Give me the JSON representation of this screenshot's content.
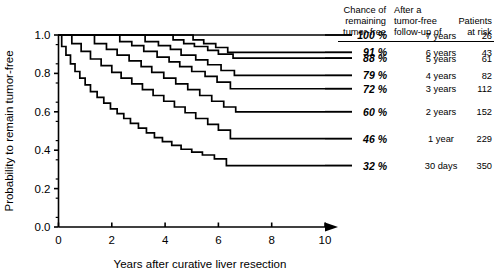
{
  "chart_data": {
    "type": "line",
    "title": "",
    "xlabel": "Years after curative liver resection",
    "ylabel": "Probability to remain tumor-free",
    "xlim": [
      0,
      10
    ],
    "ylim": [
      0,
      1.0
    ],
    "xticks": [
      "0",
      "2",
      "4",
      "6",
      "8",
      "10"
    ],
    "yticks": [
      "0.0",
      "0.2",
      "0.4",
      "0.6",
      "0.8",
      "1.0"
    ],
    "grid": false,
    "legend_position": "right-outside",
    "minor_ticks": true,
    "x_axis_arrow": true,
    "series": [
      {
        "name": "7 years",
        "chance_percent": "100 %",
        "followup": "7 years",
        "patients_at_risk": "26",
        "plateau_value": 1.0,
        "points": [
          [
            0.0,
            1.0
          ],
          [
            6.7,
            1.0
          ],
          [
            10.0,
            1.0
          ]
        ]
      },
      {
        "name": "6 years",
        "chance_percent": "91 %",
        "followup": "6 years",
        "patients_at_risk": "43",
        "plateau_value": 0.91,
        "points": [
          [
            0.0,
            1.0
          ],
          [
            5.05,
            1.0
          ],
          [
            5.05,
            0.975
          ],
          [
            5.45,
            0.975
          ],
          [
            5.45,
            0.955
          ],
          [
            5.9,
            0.955
          ],
          [
            5.9,
            0.935
          ],
          [
            6.35,
            0.935
          ],
          [
            6.35,
            0.91
          ],
          [
            10.0,
            0.91
          ]
        ]
      },
      {
        "name": "5 years",
        "chance_percent": "88 %",
        "followup": "5 years",
        "patients_at_risk": "61",
        "plateau_value": 0.88,
        "points": [
          [
            0.0,
            1.0
          ],
          [
            4.3,
            1.0
          ],
          [
            4.3,
            0.975
          ],
          [
            4.7,
            0.975
          ],
          [
            4.7,
            0.955
          ],
          [
            5.1,
            0.955
          ],
          [
            5.1,
            0.94
          ],
          [
            5.6,
            0.94
          ],
          [
            5.6,
            0.92
          ],
          [
            6.0,
            0.92
          ],
          [
            6.0,
            0.9
          ],
          [
            6.55,
            0.9
          ],
          [
            6.55,
            0.88
          ],
          [
            10.0,
            0.88
          ]
        ]
      },
      {
        "name": "4 years",
        "chance_percent": "79 %",
        "followup": "4 years",
        "patients_at_risk": "82",
        "plateau_value": 0.79,
        "points": [
          [
            0.0,
            1.0
          ],
          [
            3.25,
            1.0
          ],
          [
            3.25,
            0.965
          ],
          [
            3.75,
            0.965
          ],
          [
            3.75,
            0.945
          ],
          [
            4.2,
            0.945
          ],
          [
            4.2,
            0.925
          ],
          [
            4.6,
            0.925
          ],
          [
            4.6,
            0.895
          ],
          [
            5.15,
            0.895
          ],
          [
            5.15,
            0.87
          ],
          [
            5.6,
            0.87
          ],
          [
            5.6,
            0.845
          ],
          [
            6.1,
            0.845
          ],
          [
            6.1,
            0.815
          ],
          [
            6.6,
            0.815
          ],
          [
            6.6,
            0.79
          ],
          [
            10.0,
            0.79
          ]
        ]
      },
      {
        "name": "3 years",
        "chance_percent": "72 %",
        "followup": "3 years",
        "patients_at_risk": "112",
        "plateau_value": 0.72,
        "points": [
          [
            0.0,
            1.0
          ],
          [
            2.3,
            1.0
          ],
          [
            2.3,
            0.965
          ],
          [
            2.75,
            0.965
          ],
          [
            2.75,
            0.945
          ],
          [
            3.2,
            0.945
          ],
          [
            3.2,
            0.915
          ],
          [
            3.7,
            0.915
          ],
          [
            3.7,
            0.885
          ],
          [
            4.15,
            0.885
          ],
          [
            4.15,
            0.86
          ],
          [
            4.55,
            0.86
          ],
          [
            4.55,
            0.835
          ],
          [
            5.0,
            0.835
          ],
          [
            5.0,
            0.81
          ],
          [
            5.5,
            0.81
          ],
          [
            5.5,
            0.785
          ],
          [
            5.95,
            0.785
          ],
          [
            5.95,
            0.755
          ],
          [
            6.45,
            0.755
          ],
          [
            6.45,
            0.72
          ],
          [
            10.0,
            0.72
          ]
        ]
      },
      {
        "name": "2 years",
        "chance_percent": "60 %",
        "followup": "2 years",
        "patients_at_risk": "152",
        "plateau_value": 0.6,
        "points": [
          [
            0.0,
            1.0
          ],
          [
            1.35,
            1.0
          ],
          [
            1.35,
            0.955
          ],
          [
            1.8,
            0.955
          ],
          [
            1.8,
            0.925
          ],
          [
            2.2,
            0.925
          ],
          [
            2.2,
            0.895
          ],
          [
            2.65,
            0.895
          ],
          [
            2.65,
            0.865
          ],
          [
            3.1,
            0.865
          ],
          [
            3.1,
            0.835
          ],
          [
            3.5,
            0.835
          ],
          [
            3.5,
            0.805
          ],
          [
            3.95,
            0.805
          ],
          [
            3.95,
            0.775
          ],
          [
            4.4,
            0.775
          ],
          [
            4.4,
            0.745
          ],
          [
            4.85,
            0.745
          ],
          [
            4.85,
            0.715
          ],
          [
            5.3,
            0.715
          ],
          [
            5.3,
            0.685
          ],
          [
            5.75,
            0.685
          ],
          [
            5.75,
            0.655
          ],
          [
            6.2,
            0.655
          ],
          [
            6.2,
            0.625
          ],
          [
            6.65,
            0.625
          ],
          [
            6.65,
            0.6
          ],
          [
            10.0,
            0.6
          ]
        ]
      },
      {
        "name": "1 year",
        "chance_percent": "46 %",
        "followup": "1 year",
        "patients_at_risk": "229",
        "plateau_value": 0.46,
        "points": [
          [
            0.0,
            1.0
          ],
          [
            0.5,
            1.0
          ],
          [
            0.5,
            0.955
          ],
          [
            0.85,
            0.955
          ],
          [
            0.85,
            0.915
          ],
          [
            1.2,
            0.915
          ],
          [
            1.2,
            0.875
          ],
          [
            1.6,
            0.875
          ],
          [
            1.6,
            0.84
          ],
          [
            2.0,
            0.84
          ],
          [
            2.0,
            0.805
          ],
          [
            2.35,
            0.805
          ],
          [
            2.35,
            0.775
          ],
          [
            2.75,
            0.775
          ],
          [
            2.75,
            0.745
          ],
          [
            3.15,
            0.745
          ],
          [
            3.15,
            0.715
          ],
          [
            3.55,
            0.715
          ],
          [
            3.55,
            0.685
          ],
          [
            3.95,
            0.685
          ],
          [
            3.95,
            0.655
          ],
          [
            4.35,
            0.655
          ],
          [
            4.35,
            0.625
          ],
          [
            4.75,
            0.625
          ],
          [
            4.75,
            0.595
          ],
          [
            5.15,
            0.595
          ],
          [
            5.15,
            0.565
          ],
          [
            5.6,
            0.565
          ],
          [
            5.6,
            0.535
          ],
          [
            6.0,
            0.535
          ],
          [
            6.0,
            0.505
          ],
          [
            6.45,
            0.505
          ],
          [
            6.45,
            0.46
          ],
          [
            10.0,
            0.46
          ]
        ]
      },
      {
        "name": "30 days",
        "chance_percent": "32 %",
        "followup": "30 days",
        "patients_at_risk": "350",
        "plateau_value": 0.32,
        "points": [
          [
            0.0,
            1.0
          ],
          [
            0.12,
            1.0
          ],
          [
            0.12,
            0.94
          ],
          [
            0.28,
            0.94
          ],
          [
            0.28,
            0.895
          ],
          [
            0.45,
            0.895
          ],
          [
            0.45,
            0.85
          ],
          [
            0.62,
            0.85
          ],
          [
            0.62,
            0.81
          ],
          [
            0.8,
            0.81
          ],
          [
            0.8,
            0.775
          ],
          [
            1.0,
            0.775
          ],
          [
            1.0,
            0.74
          ],
          [
            1.2,
            0.74
          ],
          [
            1.2,
            0.705
          ],
          [
            1.45,
            0.705
          ],
          [
            1.45,
            0.675
          ],
          [
            1.7,
            0.675
          ],
          [
            1.7,
            0.645
          ],
          [
            1.95,
            0.645
          ],
          [
            1.95,
            0.615
          ],
          [
            2.2,
            0.615
          ],
          [
            2.2,
            0.59
          ],
          [
            2.45,
            0.59
          ],
          [
            2.45,
            0.565
          ],
          [
            2.7,
            0.565
          ],
          [
            2.7,
            0.54
          ],
          [
            3.0,
            0.54
          ],
          [
            3.0,
            0.515
          ],
          [
            3.3,
            0.515
          ],
          [
            3.3,
            0.49
          ],
          [
            3.6,
            0.49
          ],
          [
            3.6,
            0.465
          ],
          [
            3.9,
            0.465
          ],
          [
            3.9,
            0.445
          ],
          [
            4.25,
            0.445
          ],
          [
            4.25,
            0.425
          ],
          [
            4.6,
            0.425
          ],
          [
            4.6,
            0.405
          ],
          [
            5.0,
            0.405
          ],
          [
            5.0,
            0.39
          ],
          [
            5.4,
            0.39
          ],
          [
            5.4,
            0.375
          ],
          [
            5.85,
            0.375
          ],
          [
            5.85,
            0.355
          ],
          [
            6.3,
            0.355
          ],
          [
            6.3,
            0.32
          ],
          [
            10.0,
            0.32
          ]
        ]
      }
    ]
  },
  "legend": {
    "headers": {
      "col1_line1": "Chance of",
      "col1_line2": "remaining",
      "col1_line3": "tumor-free",
      "col2_line1": "After a",
      "col2_line2": "tumor-free",
      "col2_line3": "follow-up of",
      "col3_line1": "Patients",
      "col3_line2": "at risk"
    }
  },
  "colors": {
    "line": "#000000",
    "axis": "#000000",
    "background": "#ffffff"
  }
}
